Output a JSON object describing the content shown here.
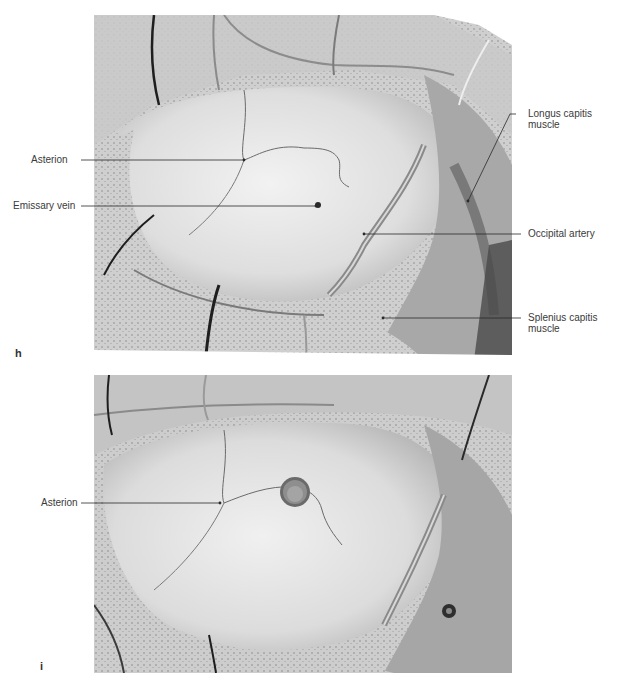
{
  "figure": {
    "panels": [
      {
        "id": "h",
        "letter": "h",
        "labels": {
          "asterion": "Asterion",
          "emissary_vein": "Emissary vein",
          "longus_capitis": "Longus capitis muscle",
          "occipital_artery": "Occipital artery",
          "splenius_capitis": "Splenius capitis muscle"
        }
      },
      {
        "id": "i",
        "letter": "i",
        "labels": {
          "asterion": "Asterion"
        }
      }
    ],
    "colors": {
      "background": "#ffffff",
      "label_text": "#3a3a3a",
      "leader_line": "#2a2a2a",
      "photo_light": "#e6e6e6",
      "photo_mid": "#b5b5b5",
      "photo_dark": "#4a4a4a"
    }
  }
}
